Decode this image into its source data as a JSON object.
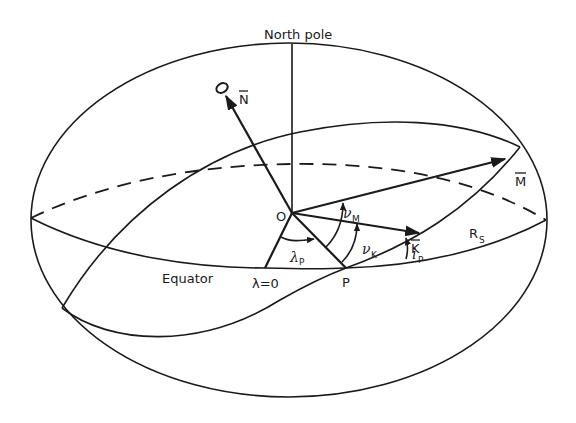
{
  "figure": {
    "labels": {
      "north_pole": "North pole",
      "equator": "Equator",
      "origin": "O",
      "point_p": "P",
      "lambda_zero": "λ=0",
      "vector_n": "N",
      "vector_m": "M",
      "vector_k": "K",
      "radius_s_main": "R",
      "radius_s_sub": "S",
      "nu_m_main": "ν",
      "nu_m_sub": "M",
      "nu_k_main": "ν",
      "nu_k_sub": "K",
      "lambda_p_main": "λ",
      "lambda_p_sub": "P",
      "i_p_main": "i",
      "i_p_sub": "P"
    },
    "colors": {
      "line": "#1a1a1a",
      "background": "#ffffff"
    }
  }
}
